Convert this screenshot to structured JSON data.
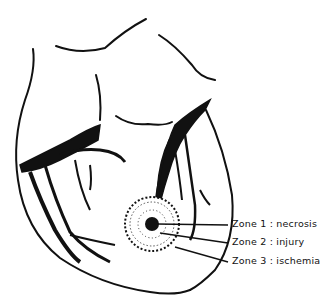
{
  "figure": {
    "labels": [
      {
        "text": "Zone 1 : necrosis"
      },
      {
        "text": "Zone 2 : injury"
      },
      {
        "text": "Zone 3 : ischemia"
      }
    ],
    "colors": {
      "ink": "#111111",
      "background": "#ffffff"
    }
  }
}
